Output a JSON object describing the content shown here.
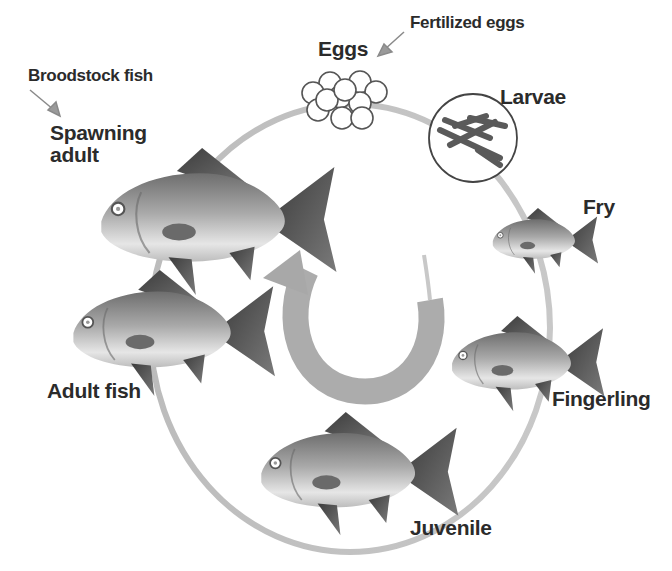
{
  "diagram": {
    "title": "",
    "type": "life-cycle",
    "stages": [
      {
        "id": "eggs",
        "label": "Eggs"
      },
      {
        "id": "larvae",
        "label": "Larvae"
      },
      {
        "id": "fry",
        "label": "Fry"
      },
      {
        "id": "fingerling",
        "label": "Fingerling"
      },
      {
        "id": "juvenile",
        "label": "Juvenile"
      },
      {
        "id": "adult",
        "label": "Adult fish"
      },
      {
        "id": "spawning",
        "label_line1": "Spawning",
        "label_line2": "adult"
      }
    ],
    "annotations": {
      "fertilized": "Fertilized eggs",
      "broodstock": "Broodstock fish"
    },
    "cycle_direction": "clockwise",
    "colors": {
      "ring": "#b8b8b8",
      "fish_body": "#9a9a9a",
      "fish_dark": "#4a4a4a",
      "text": "#2b2b2b",
      "center_arrow": "#a8a8a8"
    }
  }
}
